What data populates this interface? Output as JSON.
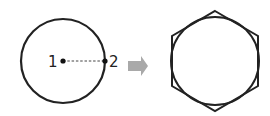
{
  "diagram": {
    "left": {
      "shape": "circle",
      "point1_label": "1",
      "point2_label": "2",
      "stroke_color": "#222222"
    },
    "arrow": {
      "icon": "right-arrow-icon",
      "color": "#a9a9a9"
    },
    "right": {
      "shape": "hexagon-circumscribing-circle",
      "stroke_color": "#222222"
    }
  }
}
